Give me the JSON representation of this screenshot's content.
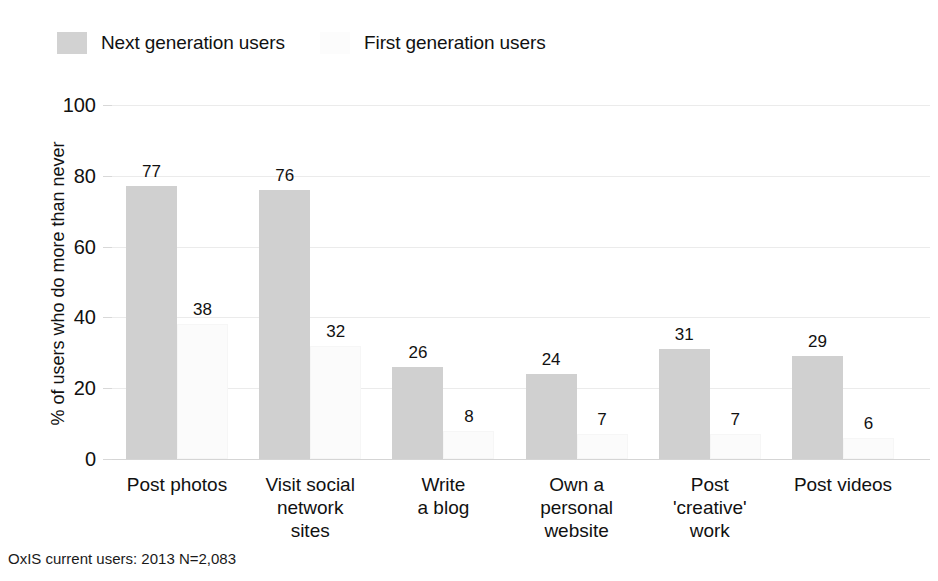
{
  "chart_data": {
    "type": "bar",
    "title": "",
    "xlabel": "",
    "ylabel": "% of users who do more than never",
    "ylim": [
      0,
      100
    ],
    "yticks": [
      0,
      20,
      40,
      60,
      80,
      100
    ],
    "grid": true,
    "legend_position": "top-left",
    "categories": [
      "Post photos",
      "Visit social network sites",
      "Write a blog",
      "Own a personal website",
      "Post 'creative' work",
      "Post videos"
    ],
    "category_lines": [
      [
        "Post photos"
      ],
      [
        "Visit social",
        "network",
        "sites"
      ],
      [
        "Write",
        "a blog"
      ],
      [
        "Own a",
        "personal",
        "website"
      ],
      [
        "Post",
        "'creative'",
        "work"
      ],
      [
        "Post videos"
      ]
    ],
    "series": [
      {
        "name": "Next generation users",
        "color": "#d0d0d0",
        "values": [
          77,
          76,
          26,
          24,
          31,
          29
        ]
      },
      {
        "name": "First generation users",
        "color": "#fbfbfb",
        "values": [
          38,
          32,
          8,
          7,
          7,
          6
        ]
      }
    ],
    "footnote": "OxIS current users: 2013 N=2,083"
  },
  "legend": {
    "items": [
      {
        "label": "Next generation users",
        "swatch": "next"
      },
      {
        "label": "First generation users",
        "swatch": "first"
      }
    ]
  },
  "axis": {
    "y_title": "% of users who do more than never",
    "y_tick_labels": [
      "100",
      "80",
      "60",
      "40",
      "20",
      "0"
    ]
  },
  "footnote": {
    "text": "OxIS current users: 2013 N=2,083"
  },
  "colors": {
    "next_generation": "#d0d0d0",
    "first_generation": "#fbfbfb",
    "gridline": "#ebebeb",
    "text": "#111111"
  }
}
